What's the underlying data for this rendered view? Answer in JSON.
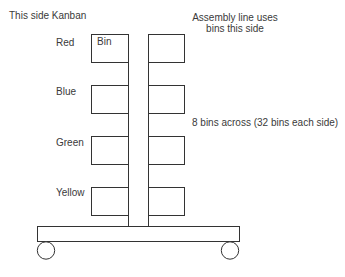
{
  "title_left": "This side Kanban",
  "title_right": {
    "line1": "Assembly line uses",
    "line2": "bins this side"
  },
  "annotation": "8 bins across (32 bins each side)",
  "bin_label": "Bin",
  "rows": [
    {
      "label": "Red"
    },
    {
      "label": "Blue"
    },
    {
      "label": "Green"
    },
    {
      "label": "Yellow"
    }
  ],
  "colors": {
    "line": "#333333",
    "text": "#3a3a3a",
    "background": "#ffffff"
  }
}
